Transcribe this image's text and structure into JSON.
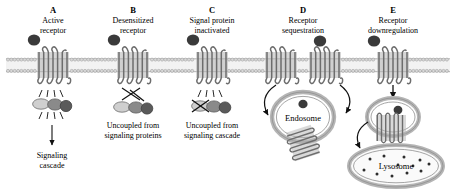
{
  "figure": {
    "membrane_label": "plasma-membrane-lipid-bilayer"
  },
  "colors": {
    "receptor_fill": "#a8a8a8",
    "receptor_stroke": "#6d6d6d",
    "membrane_head": "#d8d8d8",
    "membrane_stroke": "#a0a0a0",
    "ligand": "#3a3a3a",
    "g_alpha": "#cfcfcf",
    "g_beta": "#8a8a8a",
    "g_gamma": "#5a5a5a",
    "vesicle": "#b5b5b5",
    "ink": "#111111"
  },
  "panels": [
    {
      "letter": "A",
      "heading_line1": "Active",
      "heading_line2": "receptor",
      "caption_line1": "Signaling",
      "caption_line2": "cascade",
      "has_ligand": true,
      "state": "active"
    },
    {
      "letter": "B",
      "heading_line1": "Desensitized",
      "heading_line2": "receptor",
      "caption_line1": "Uncoupled from",
      "caption_line2": "signaling proteins",
      "has_ligand": true,
      "state": "desensitized"
    },
    {
      "letter": "C",
      "heading_line1": "Signal protein",
      "heading_line2": "inactivated",
      "caption_line1": "Uncoupled from",
      "caption_line2": "signaling cascade",
      "has_ligand": true,
      "state": "signal-protein-inactivated"
    },
    {
      "letter": "D",
      "heading_line1": "Receptor",
      "heading_line2": "sequestration",
      "caption_line1": "",
      "caption_line2": "",
      "has_ligand": true,
      "state": "sequestration",
      "organelle": "Endosome"
    },
    {
      "letter": "E",
      "heading_line1": "Receptor",
      "heading_line2": "downregulation",
      "caption_line1": "",
      "caption_line2": "",
      "has_ligand": true,
      "state": "downregulation",
      "organelle_upper": "Endosome",
      "organelle_lower": "Lysosome"
    }
  ],
  "organelles": {
    "endosome_d": "Endosome",
    "lysosome_e": "Lysosome"
  }
}
